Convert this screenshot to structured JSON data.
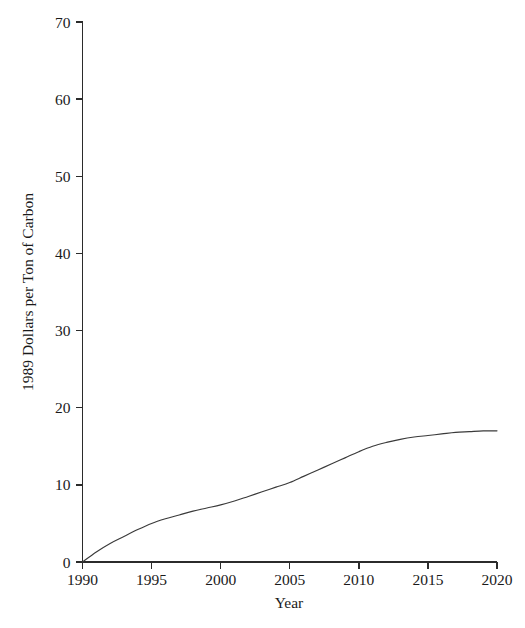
{
  "chart_data": {
    "type": "line",
    "title": "",
    "subtitle": "",
    "xlabel": "Year",
    "ylabel": "1989 Dollars per Ton of Carbon",
    "xlim": [
      1990,
      2020
    ],
    "ylim": [
      0,
      70
    ],
    "grid": false,
    "legend": null,
    "legend_position": "none",
    "x_ticks": [
      1990,
      1995,
      2000,
      2005,
      2010,
      2015,
      2020
    ],
    "x_tick_labels": [
      "1990",
      "1995",
      "2000",
      "2005",
      "2010",
      "2015",
      "2020"
    ],
    "y_ticks": [
      0,
      10,
      20,
      30,
      40,
      50,
      60,
      70
    ],
    "y_tick_labels": [
      "0",
      "10",
      "20",
      "30",
      "40",
      "50",
      "60",
      "70"
    ],
    "series": [
      {
        "name": "Carbon price",
        "color": "#3a3a3a",
        "x": [
          1990,
          1991,
          1992,
          1993,
          1994,
          1995,
          1996,
          1997,
          1998,
          1999,
          2000,
          2001,
          2002,
          2003,
          2004,
          2005,
          2006,
          2007,
          2008,
          2009,
          2010,
          2011,
          2012,
          2013,
          2014,
          2015,
          2016,
          2017,
          2018,
          2019,
          2020
        ],
        "values": [
          0.0,
          1.3,
          2.4,
          3.3,
          4.2,
          5.0,
          5.6,
          6.1,
          6.6,
          7.0,
          7.4,
          7.9,
          8.5,
          9.1,
          9.7,
          10.3,
          11.1,
          11.9,
          12.7,
          13.5,
          14.3,
          15.0,
          15.5,
          15.9,
          16.2,
          16.4,
          16.6,
          16.8,
          16.9,
          17.0,
          17.0
        ]
      }
    ]
  },
  "axes": {
    "x_label": "Year",
    "y_label": "1989 Dollars per Ton of Carbon"
  }
}
